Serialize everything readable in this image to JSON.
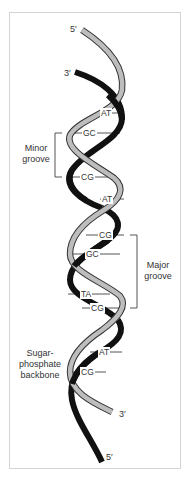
{
  "figure": {
    "ends": {
      "top_gray": "5′",
      "top_black": "3′",
      "bottom_gray": "3′",
      "bottom_black": "5′"
    },
    "base_pairs": [
      {
        "label": "AT",
        "y": 113
      },
      {
        "label": "GC",
        "y": 133
      },
      {
        "label": "CG",
        "y": 177
      },
      {
        "label": "AT",
        "y": 199
      },
      {
        "label": "CG",
        "y": 235
      },
      {
        "label": "GC",
        "y": 254
      },
      {
        "label": "TA",
        "y": 294
      },
      {
        "label": "CG",
        "y": 308
      },
      {
        "label": "AT",
        "y": 352
      },
      {
        "label": "CG",
        "y": 372
      }
    ],
    "annotations": {
      "minor_groove": [
        "Minor",
        "groove"
      ],
      "major_groove": [
        "Major",
        "groove"
      ],
      "backbone": [
        "Sugar-",
        "phosphate",
        "backbone"
      ]
    },
    "colors": {
      "strand_gray": "#b8b8b8",
      "strand_black": "#111111",
      "frame": "#d4d4d4",
      "text": "#333333"
    }
  }
}
